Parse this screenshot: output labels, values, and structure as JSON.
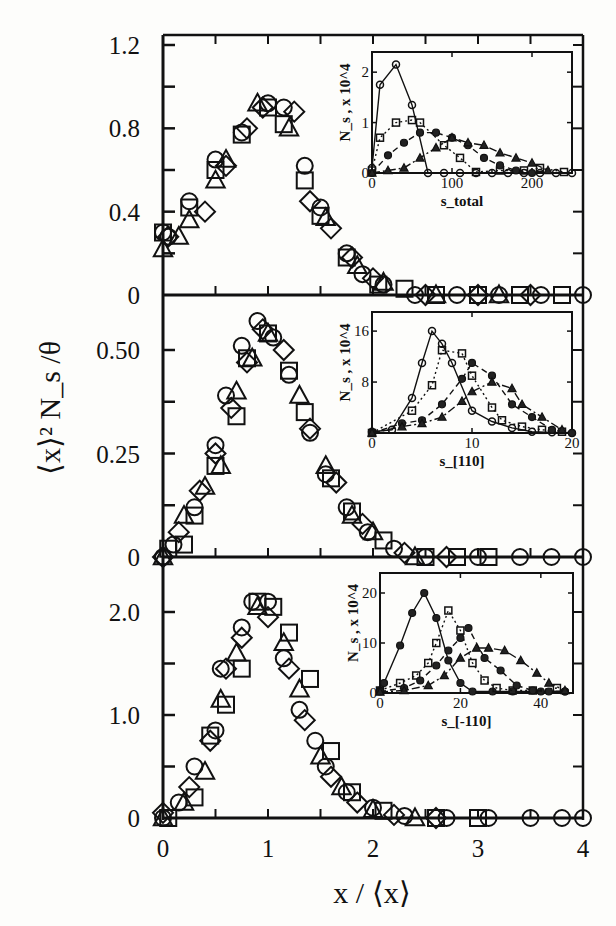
{
  "figure": {
    "xlabel": "x / ⟨x⟩",
    "ylabel": "⟨x⟩² N_s /θ",
    "x_ticks": [
      "0",
      "1",
      "2",
      "3",
      "4"
    ]
  },
  "chart_data": [
    {
      "type": "scatter",
      "panel": "top",
      "xlabel": "x / ⟨x⟩",
      "ylabel": "⟨x⟩² N_s /θ",
      "xlim": [
        0,
        4
      ],
      "ylim": [
        0,
        1.2
      ],
      "y_ticks": [
        "0",
        "0.4",
        "0.8",
        "1.2"
      ],
      "grid": false,
      "series": [
        {
          "name": "circle",
          "marker": "circle",
          "x": [
            0.0,
            0.05,
            0.25,
            0.5,
            0.75,
            1.0,
            1.15,
            1.35,
            1.5,
            1.75,
            1.9,
            2.1,
            2.4,
            2.8,
            3.2,
            3.6,
            4.0
          ],
          "y": [
            0.3,
            0.28,
            0.45,
            0.65,
            0.78,
            0.92,
            0.9,
            0.62,
            0.42,
            0.2,
            0.1,
            0.05,
            0.0,
            0.0,
            0.0,
            0.0,
            0.0
          ]
        },
        {
          "name": "square",
          "marker": "square",
          "x": [
            0.0,
            0.25,
            0.5,
            0.75,
            1.0,
            1.15,
            1.35,
            1.5,
            1.75,
            2.05,
            2.3,
            2.6,
            3.0,
            3.4,
            3.8
          ],
          "y": [
            0.3,
            0.42,
            0.6,
            0.77,
            0.9,
            0.82,
            0.55,
            0.38,
            0.18,
            0.05,
            0.03,
            0.0,
            0.0,
            0.0,
            0.0
          ]
        },
        {
          "name": "diamond",
          "marker": "diamond",
          "x": [
            0.05,
            0.4,
            0.6,
            0.8,
            0.95,
            1.25,
            1.4,
            1.6,
            1.8,
            2.0,
            2.5,
            3.0,
            3.5
          ],
          "y": [
            0.28,
            0.4,
            0.62,
            0.8,
            0.9,
            0.88,
            0.45,
            0.32,
            0.18,
            0.08,
            0.0,
            0.0,
            0.0
          ]
        },
        {
          "name": "triangle",
          "marker": "triangle",
          "x": [
            0.0,
            0.15,
            0.25,
            0.5,
            0.6,
            0.9,
            1.2,
            1.55,
            1.85,
            2.1,
            2.6,
            3.2
          ],
          "y": [
            0.22,
            0.28,
            0.36,
            0.55,
            0.65,
            0.92,
            0.8,
            0.37,
            0.14,
            0.06,
            0.0,
            0.0
          ]
        }
      ],
      "inset": {
        "xlabel": "s_total",
        "ylabel": "N_s , x 10^4",
        "xlim": [
          0,
          250
        ],
        "ylim": [
          0,
          2.4
        ],
        "x_ticks": [
          "0",
          "100",
          "200"
        ],
        "y_ticks": [
          "0",
          "1",
          "2"
        ],
        "series": [
          {
            "name": "open-circle",
            "marker": "circle",
            "line": "solid",
            "x": [
              0,
              10,
              30,
              50,
              70,
              90,
              110,
              130,
              150,
              170,
              190,
              210,
              230,
              250
            ],
            "y": [
              0.1,
              1.75,
              2.15,
              1.35,
              0.0,
              0.0,
              0.0,
              0.0,
              0.0,
              0.0,
              0.0,
              0.0,
              0.0,
              0.0
            ]
          },
          {
            "name": "open-square",
            "marker": "square",
            "line": "dotted",
            "x": [
              0,
              10,
              30,
              50,
              60,
              90,
              110,
              130,
              160,
              190,
              210,
              240
            ],
            "y": [
              0.05,
              0.7,
              1.0,
              1.05,
              1.0,
              0.55,
              0.3,
              0.02,
              0.05,
              0.05,
              0.1,
              0.02
            ]
          },
          {
            "name": "filled-circle",
            "marker": "filled-circle",
            "line": "dashed",
            "x": [
              0,
              20,
              40,
              60,
              80,
              100,
              120,
              140,
              160,
              180,
              200
            ],
            "y": [
              0.0,
              0.35,
              0.6,
              0.8,
              0.8,
              0.7,
              0.55,
              0.3,
              0.15,
              0.05,
              0.0
            ]
          },
          {
            "name": "filled-triangle",
            "marker": "filled-triangle",
            "line": "dash-dot",
            "x": [
              0,
              20,
              40,
              60,
              80,
              100,
              120,
              140,
              160,
              180,
              200,
              220
            ],
            "y": [
              0.0,
              0.05,
              0.1,
              0.3,
              0.5,
              0.7,
              0.6,
              0.55,
              0.4,
              0.3,
              0.2,
              0.05
            ]
          }
        ]
      }
    },
    {
      "type": "scatter",
      "panel": "middle",
      "xlabel": "x / ⟨x⟩",
      "ylabel": "⟨x⟩² N_s /θ",
      "xlim": [
        0,
        4
      ],
      "ylim": [
        0,
        0.58
      ],
      "y_ticks": [
        "0",
        "0.25",
        "0.50"
      ],
      "grid": false,
      "series": [
        {
          "name": "circle",
          "marker": "circle",
          "x": [
            0.0,
            0.1,
            0.3,
            0.5,
            0.6,
            0.75,
            0.9,
            1.05,
            1.2,
            1.4,
            1.55,
            1.75,
            1.95,
            2.2,
            2.5,
            3.0,
            3.4,
            3.7,
            4.0
          ],
          "y": [
            0.0,
            0.03,
            0.12,
            0.27,
            0.39,
            0.51,
            0.57,
            0.53,
            0.44,
            0.3,
            0.2,
            0.12,
            0.06,
            0.02,
            0.0,
            0.0,
            0.0,
            0.0,
            0.0
          ]
        },
        {
          "name": "square",
          "marker": "square",
          "x": [
            0.05,
            0.2,
            0.3,
            0.5,
            0.7,
            0.8,
            1.0,
            1.2,
            1.35,
            1.6,
            1.8,
            2.1,
            2.5,
            2.8,
            3.1
          ],
          "y": [
            0.02,
            0.03,
            0.1,
            0.22,
            0.34,
            0.48,
            0.54,
            0.45,
            0.35,
            0.19,
            0.11,
            0.04,
            0.0,
            0.0,
            0.0
          ]
        },
        {
          "name": "diamond",
          "marker": "diamond",
          "x": [
            0.0,
            0.15,
            0.35,
            0.5,
            0.65,
            0.8,
            0.95,
            1.15,
            1.4,
            1.65,
            1.9,
            2.3,
            2.7
          ],
          "y": [
            0.0,
            0.06,
            0.16,
            0.25,
            0.36,
            0.47,
            0.55,
            0.5,
            0.31,
            0.18,
            0.08,
            0.01,
            0.0
          ]
        },
        {
          "name": "triangle",
          "marker": "triangle",
          "x": [
            0.0,
            0.2,
            0.4,
            0.55,
            0.7,
            0.85,
            1.0,
            1.3,
            1.55,
            1.8,
            2.0,
            2.4
          ],
          "y": [
            0.0,
            0.1,
            0.17,
            0.22,
            0.4,
            0.48,
            0.54,
            0.39,
            0.22,
            0.1,
            0.06,
            0.0
          ]
        }
      ],
      "inset": {
        "xlabel": "s_[110]",
        "ylabel": "N_s , x 10^4",
        "xlim": [
          0,
          20
        ],
        "ylim": [
          0,
          19
        ],
        "x_ticks": [
          "0",
          "10",
          "20"
        ],
        "y_ticks": [
          "8",
          "16"
        ],
        "series": [
          {
            "name": "open-circle",
            "marker": "circle",
            "line": "solid",
            "x": [
              0,
              2,
              4,
              5,
              6,
              7,
              8,
              10,
              12,
              14,
              16,
              18,
              20
            ],
            "y": [
              0.2,
              0.5,
              5.5,
              11.0,
              16.0,
              14.0,
              11.0,
              3.5,
              1.8,
              0.8,
              0.2,
              0.1,
              0.0
            ]
          },
          {
            "name": "open-square",
            "marker": "square",
            "line": "dotted",
            "x": [
              0,
              4,
              6,
              7,
              9,
              10,
              12,
              13,
              15,
              17,
              19
            ],
            "y": [
              0.0,
              3.5,
              7.5,
              13.0,
              12.5,
              9.0,
              4.0,
              2.0,
              1.0,
              0.5,
              0.2
            ]
          },
          {
            "name": "filled-circle",
            "marker": "filled-circle",
            "line": "dashed",
            "x": [
              0,
              3,
              5,
              7,
              9,
              10,
              12,
              14,
              16,
              18,
              20
            ],
            "y": [
              0.0,
              1.5,
              2.0,
              4.5,
              8.5,
              11.0,
              9.0,
              4.5,
              2.5,
              0.5,
              0.0
            ]
          },
          {
            "name": "filled-triangle",
            "marker": "filled-triangle",
            "line": "dash-dot",
            "x": [
              0,
              3,
              5,
              7,
              9,
              10,
              12,
              14,
              15,
              17,
              19
            ],
            "y": [
              0.0,
              1.0,
              1.5,
              2.5,
              5.0,
              6.5,
              8.0,
              7.0,
              4.5,
              2.5,
              0.5
            ]
          }
        ]
      }
    },
    {
      "type": "scatter",
      "panel": "bottom",
      "xlabel": "x / ⟨x⟩",
      "ylabel": "⟨x⟩² N_s /θ",
      "xlim": [
        0,
        4
      ],
      "ylim": [
        0,
        2.35
      ],
      "y_ticks": [
        "0",
        "1.0",
        "2.0"
      ],
      "grid": false,
      "series": [
        {
          "name": "circle",
          "marker": "circle",
          "x": [
            0.0,
            0.15,
            0.3,
            0.5,
            0.55,
            0.75,
            0.85,
            1.0,
            1.15,
            1.3,
            1.45,
            1.55,
            1.75,
            2.0,
            2.3,
            2.7,
            3.1,
            3.5,
            3.8,
            4.0
          ],
          "y": [
            0.0,
            0.15,
            0.5,
            0.85,
            1.45,
            1.85,
            2.1,
            2.1,
            1.55,
            1.05,
            0.75,
            0.5,
            0.25,
            0.1,
            0.02,
            0.0,
            0.0,
            0.0,
            0.0,
            0.0
          ]
        },
        {
          "name": "square",
          "marker": "square",
          "x": [
            0.05,
            0.3,
            0.45,
            0.6,
            0.75,
            0.9,
            1.05,
            1.2,
            1.4,
            1.6,
            1.8,
            2.1,
            2.6,
            3.0
          ],
          "y": [
            0.0,
            0.2,
            0.8,
            1.1,
            1.45,
            2.1,
            2.05,
            1.8,
            1.35,
            0.65,
            0.25,
            0.07,
            0.0,
            0.0
          ]
        },
        {
          "name": "diamond",
          "marker": "diamond",
          "x": [
            0.0,
            0.25,
            0.45,
            0.6,
            0.75,
            1.0,
            1.2,
            1.35,
            1.6,
            1.85,
            2.2,
            2.6
          ],
          "y": [
            0.05,
            0.3,
            0.75,
            1.45,
            1.75,
            1.95,
            1.45,
            0.95,
            0.4,
            0.15,
            0.03,
            0.0
          ]
        },
        {
          "name": "triangle",
          "marker": "triangle",
          "x": [
            0.0,
            0.2,
            0.4,
            0.55,
            0.7,
            0.9,
            1.15,
            1.3,
            1.5,
            1.7,
            2.0,
            2.4
          ],
          "y": [
            0.0,
            0.15,
            0.45,
            1.15,
            1.6,
            2.05,
            1.7,
            1.25,
            0.6,
            0.3,
            0.08,
            0.0
          ]
        }
      ],
      "inset": {
        "xlabel": "s_[-110]",
        "ylabel": "N_s , x 10^4",
        "xlim": [
          0,
          48
        ],
        "ylim": [
          0,
          24
        ],
        "x_ticks": [
          "0",
          "20",
          "40"
        ],
        "y_ticks": [
          "0",
          "10",
          "20"
        ],
        "series": [
          {
            "name": "open-circle",
            "marker": "filled-circle",
            "line": "solid",
            "x": [
              0,
              1,
              5,
              8,
              11,
              14,
              17,
              20,
              23,
              28,
              33,
              40,
              46
            ],
            "y": [
              0.5,
              2.0,
              9.5,
              16.0,
              20.0,
              15.0,
              6.5,
              2.0,
              0.3,
              0.3,
              0.3,
              0.3,
              0.3
            ]
          },
          {
            "name": "open-square",
            "marker": "square",
            "line": "dotted",
            "x": [
              0,
              5,
              9,
              12,
              14,
              17,
              20,
              23,
              26,
              29,
              33,
              38,
              44
            ],
            "y": [
              0.5,
              2.0,
              3.5,
              6.0,
              10.0,
              16.5,
              12.5,
              6.0,
              2.5,
              1.0,
              0.5,
              0.5,
              1.0
            ]
          },
          {
            "name": "filled-circle",
            "marker": "filled-circle",
            "line": "dashed",
            "x": [
              0,
              6,
              10,
              14,
              17,
              20,
              22,
              26,
              30,
              34,
              38,
              42,
              46
            ],
            "y": [
              0.3,
              1.0,
              2.5,
              5.5,
              8.5,
              11.0,
              13.0,
              7.0,
              4.5,
              1.5,
              0.5,
              0.3,
              0.3
            ]
          },
          {
            "name": "filled-triangle",
            "marker": "filled-triangle",
            "line": "dash-dot",
            "x": [
              0,
              6,
              12,
              16,
              20,
              24,
              27,
              31,
              35,
              39,
              42,
              46
            ],
            "y": [
              0.2,
              0.5,
              1.5,
              3.5,
              7.0,
              9.0,
              9.0,
              8.5,
              6.5,
              4.0,
              2.0,
              0.5
            ]
          }
        ]
      }
    }
  ]
}
